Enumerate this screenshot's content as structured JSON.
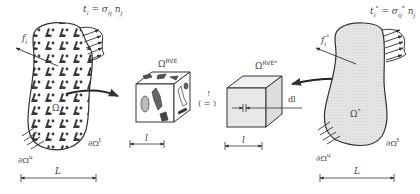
{
  "diagram": {
    "colors": {
      "stroke": "#333333",
      "inclusion_fill": "#4a4a4a",
      "homogeneous_fill": "#e6e6e6",
      "cube_fill": "#ffffff",
      "cube_homog_fill": "#e8e8e8"
    },
    "left_body": {
      "traction_label": "t",
      "traction_sub": "i",
      "traction_rhs": "= σ",
      "traction_rhs_sub": "ij",
      "traction_n": "n",
      "traction_n_sub": "j",
      "body_force_label": "f",
      "body_force_sub": "i",
      "domain_label": "Ω",
      "boundary_u": "∂Ω",
      "boundary_u_sup": "u",
      "boundary_t": "∂Ω",
      "boundary_t_sup": "t",
      "length_label": "L"
    },
    "rve": {
      "label": "Ω",
      "label_sup": "RVE",
      "length_label": "l"
    },
    "equivalence": {
      "mark": "!",
      "symbol": "( = )"
    },
    "rve_homog": {
      "label": "Ω",
      "label_sup": "RVE*",
      "length_label": "l",
      "dl_label": "dl"
    },
    "right_body": {
      "traction_label": "t",
      "traction_sub": "i",
      "traction_sup": "*",
      "traction_rhs": "= σ",
      "traction_rhs_sub": "ij",
      "traction_rhs_sup": "*",
      "traction_n": "n",
      "traction_n_sub": "j",
      "body_force_label": "f",
      "body_force_sub": "i",
      "body_force_sup": "*",
      "domain_label": "Ω",
      "domain_sup": "*",
      "boundary_u": "∂Ω",
      "boundary_u_sup": "u",
      "boundary_t": "∂Ω",
      "boundary_t_sup": "t",
      "length_label": "L"
    }
  }
}
